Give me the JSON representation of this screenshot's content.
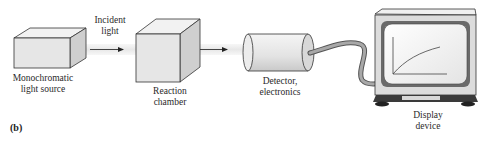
{
  "figure": {
    "panel_label": "(b)",
    "components": [
      {
        "id": "source",
        "label_line1": "Monochromatic",
        "label_line2": "light source"
      },
      {
        "id": "chamber",
        "label_line1": "Reaction",
        "label_line2": "chamber"
      },
      {
        "id": "detector",
        "label_line1": "Detector,",
        "label_line2": "electronics"
      },
      {
        "id": "display",
        "label_line1": "Display",
        "label_line2": "device"
      }
    ],
    "beam_label_line1": "Incident",
    "beam_label_line2": "light",
    "colors": {
      "box_front": "#e6e6e6",
      "box_side": "#cfcfcf",
      "box_top": "#f2f2f2",
      "edge": "#333333",
      "beam": "#eeeeee",
      "cable": "#8a8a8a",
      "monitor_base": "#3a3a3a"
    }
  }
}
